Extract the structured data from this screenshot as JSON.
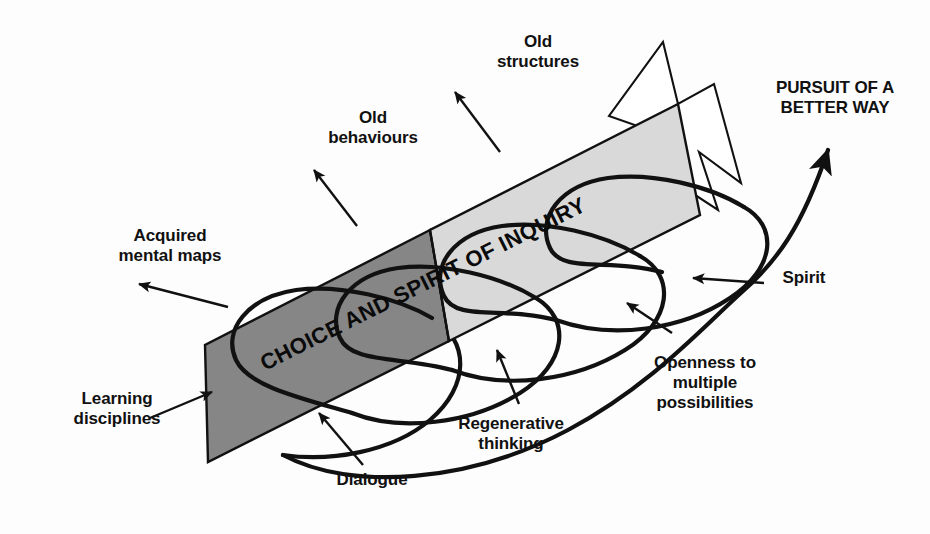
{
  "diagram": {
    "title_on_band": "CHOICE AND SPIRIT OF INQUIRY",
    "goal_label": "PURSUIT OF A\nBETTER WAY",
    "colors": {
      "background": "#fdfdfd",
      "band_dark": "#868686",
      "band_light": "#d9d9d9",
      "stroke": "#111111",
      "text": "#111111",
      "outline_arrow_fill": "#ffffff"
    },
    "labels": [
      {
        "id": "old-structures",
        "text": "Old\nstructures",
        "x": 483,
        "y": 32,
        "width": 110
      },
      {
        "id": "old-behaviours",
        "text": "Old\nbehaviours",
        "x": 313,
        "y": 108,
        "width": 120
      },
      {
        "id": "acquired-maps",
        "text": "Acquired\nmental maps",
        "x": 90,
        "y": 226,
        "width": 160
      },
      {
        "id": "learning-discip",
        "text": "Learning\ndisciplines",
        "x": 52,
        "y": 389,
        "width": 130
      },
      {
        "id": "dialogue",
        "text": "Dialogue",
        "x": 322,
        "y": 470,
        "width": 100
      },
      {
        "id": "regenerative",
        "text": "Regenerative\nthinking",
        "x": 438,
        "y": 414,
        "width": 146
      },
      {
        "id": "openness",
        "text": "Openness to\nmultiple\npossibilities",
        "x": 629,
        "y": 353,
        "width": 152
      },
      {
        "id": "spirit",
        "text": "Spirit",
        "x": 769,
        "y": 268,
        "width": 70
      },
      {
        "id": "pursuit",
        "text": "PURSUIT OF A\nBETTER WAY",
        "x": 760,
        "y": 78,
        "width": 150
      }
    ],
    "pointer_arrows": [
      {
        "id": "arrow-old-structures",
        "from": [
          500,
          152
        ],
        "to": [
          455,
          92
        ]
      },
      {
        "id": "arrow-old-behaviours",
        "from": [
          357,
          226
        ],
        "to": [
          314,
          170
        ]
      },
      {
        "id": "arrow-acquired-maps",
        "from": [
          228,
          307
        ],
        "to": [
          139,
          284
        ]
      },
      {
        "id": "arrow-learning-discip",
        "from": [
          150,
          418
        ],
        "to": [
          212,
          392
        ]
      },
      {
        "id": "arrow-dialogue",
        "from": [
          363,
          465
        ],
        "to": [
          319,
          413
        ]
      },
      {
        "id": "arrow-regenerative",
        "from": [
          519,
          404
        ],
        "to": [
          497,
          350
        ]
      },
      {
        "id": "arrow-openness",
        "from": [
          672,
          333
        ],
        "to": [
          627,
          303
        ]
      },
      {
        "id": "arrow-spirit",
        "from": [
          764,
          283
        ],
        "to": [
          693,
          278
        ]
      }
    ],
    "band": {
      "description": "broad diagonal band running lower-left to upper-right, two tone",
      "start": [
        205,
        400
      ],
      "end": [
        700,
        150
      ]
    },
    "helix": {
      "description": "continuous spiral coiling around the band, ending in an upward arrowhead",
      "loops": 4
    }
  }
}
